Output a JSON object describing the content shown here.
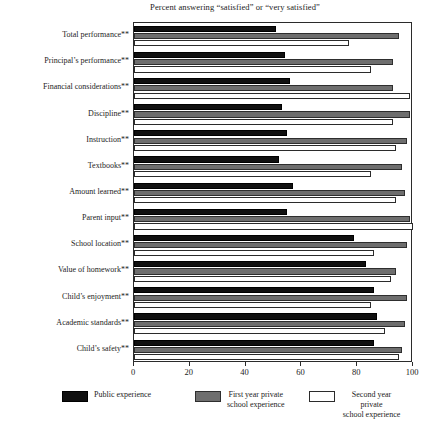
{
  "chart_data": {
    "type": "bar",
    "orientation": "horizontal",
    "title": "Percent answering “satisfied” or “very satisfied”",
    "xlabel": "",
    "ylabel": "",
    "xlim": [
      0,
      100
    ],
    "xticks": [
      0,
      20,
      40,
      60,
      80,
      100
    ],
    "xtick_labels": [
      "0",
      "20",
      "40",
      "60",
      "80",
      "100"
    ],
    "grid": false,
    "legend_position": "bottom",
    "categories": [
      "Total performance**",
      "Principal’s performance**",
      "Financial considerations**",
      "Discipline**",
      "Instruction**",
      "Textbooks**",
      "Amount learned**",
      "Parent input**",
      "School location**",
      "Value of homework**",
      "Child’s enjoyment**",
      "Academic standards**",
      "Child’s safety**"
    ],
    "series": [
      {
        "name": "Public experience",
        "color": "#101010",
        "values": [
          51,
          54,
          56,
          53,
          55,
          52,
          57,
          55,
          79,
          83,
          86,
          87,
          86
        ]
      },
      {
        "name": "First year private school experience",
        "color": "#6e6e6e",
        "values": [
          95,
          93,
          93,
          99,
          98,
          96,
          97,
          99,
          98,
          94,
          98,
          97,
          96
        ]
      },
      {
        "name": "Second year private school experience",
        "color": "#ffffff",
        "values": [
          77,
          85,
          99,
          93,
          94,
          85,
          94,
          100,
          86,
          92,
          85,
          90,
          95
        ]
      }
    ]
  },
  "legend": {
    "items": [
      {
        "label": "Public experience",
        "swatch": "sw-public"
      },
      {
        "label": "First year private\nschool experience",
        "swatch": "sw-first"
      },
      {
        "label": "Second year private\nschool experience",
        "swatch": "sw-second"
      }
    ]
  }
}
